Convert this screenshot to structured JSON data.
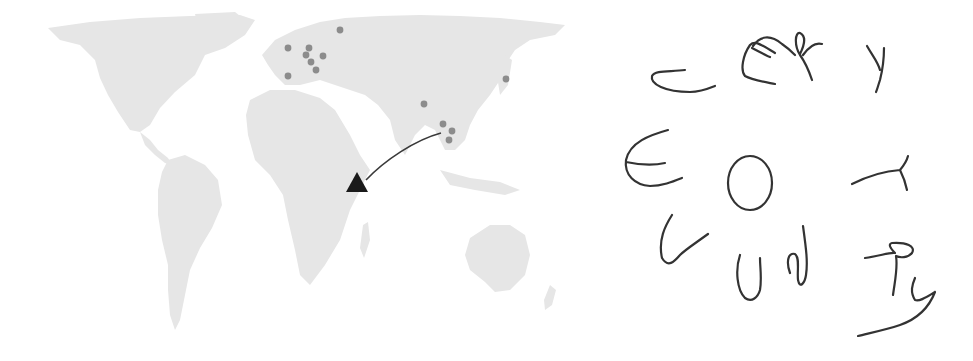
{
  "figure": {
    "left_panel": {
      "type": "world-map",
      "land_color": "#e6e6e6",
      "dot_color": "#8c8c8c",
      "marker_color": "#1a1a1a",
      "dots": [
        {
          "region": "europe",
          "x": 288,
          "y": 48
        },
        {
          "region": "europe",
          "x": 309,
          "y": 48
        },
        {
          "region": "europe",
          "x": 306,
          "y": 55
        },
        {
          "region": "europe",
          "x": 311,
          "y": 62
        },
        {
          "region": "europe",
          "x": 323,
          "y": 56
        },
        {
          "region": "europe",
          "x": 316,
          "y": 70
        },
        {
          "region": "europe",
          "x": 340,
          "y": 30
        },
        {
          "region": "europe",
          "x": 288,
          "y": 76
        },
        {
          "region": "asia",
          "x": 424,
          "y": 104
        },
        {
          "region": "asia",
          "x": 443,
          "y": 124
        },
        {
          "region": "asia",
          "x": 452,
          "y": 131
        },
        {
          "region": "asia",
          "x": 449,
          "y": 140
        },
        {
          "region": "asia",
          "x": 506,
          "y": 79
        }
      ],
      "marker": {
        "shape": "triangle",
        "x": 357,
        "y": 182
      },
      "arrow": {
        "from": [
          441,
          133
        ],
        "to": [
          364,
          180
        ]
      }
    },
    "right_panel": {
      "type": "handwriting",
      "stroke_color": "#333333",
      "glyphs_reading_order": [
        "C",
        "E",
        "R",
        "Y",
        "E",
        "O",
        "T",
        "U",
        "U",
        "N",
        "R",
        "Y"
      ],
      "words_hint": "C-E-R-Y / E-O-T / U-U-N-R-Y"
    }
  }
}
